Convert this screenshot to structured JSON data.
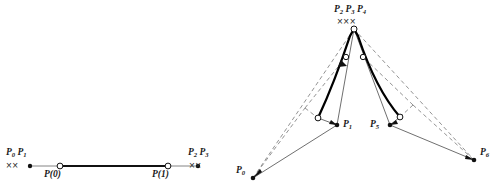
{
  "figure": {
    "caption_left": "",
    "caption_right": "",
    "background_color": "#ffffff",
    "ink_color": "#1a1a1a",
    "thick_curve_color": "#000000",
    "thin_line_color": "#555555",
    "dashed_line_color": "#777777"
  },
  "left_panel": {
    "name": "degenerate-line-segment-panel",
    "labels": {
      "start_group": "P",
      "start_group_sub_a": "0",
      "start_group_sub_b": "1",
      "start_group_text": "P0 P1",
      "end_group_text": "P2 P3",
      "end_group_sub_a": "2",
      "end_group_sub_b": "3",
      "param_start": "P",
      "param_start_arg": "(0)",
      "param_end": "P",
      "param_end_arg": "(1)"
    },
    "x_marks_left": "××",
    "x_marks_right": "××",
    "knot_multiplicity_left": 2,
    "knot_multiplicity_right": 2,
    "segment": {
      "start_x": 30,
      "start_y": 166,
      "end_x": 198,
      "end_y": 166
    },
    "open_circles": [
      {
        "label": "P(0)",
        "x": 60,
        "y": 166
      },
      {
        "label": "P(1)",
        "x": 168,
        "y": 166
      }
    ],
    "filled_dots": [
      {
        "x": 30,
        "y": 166
      },
      {
        "x": 198,
        "y": 166
      }
    ]
  },
  "right_panel": {
    "name": "cusp-curve-panel",
    "labels": {
      "apex_group_text": "P2 P3 P4",
      "apex_sub_a": "2",
      "apex_sub_b": "3",
      "apex_sub_c": "4",
      "p0": "P",
      "p0_sub": "0",
      "p1": "P",
      "p1_sub": "1",
      "p5": "P",
      "p5_sub": "5",
      "p6": "P",
      "p6_sub": "6"
    },
    "x_marks_apex": "×××",
    "knot_multiplicity_apex": 3,
    "control_points": [
      {
        "name": "P0",
        "x": 253,
        "y": 178,
        "marker": "filled"
      },
      {
        "name": "P1",
        "x": 337,
        "y": 125,
        "marker": "filled"
      },
      {
        "name": "P2P3P4",
        "x": 354,
        "y": 29,
        "marker": "open"
      },
      {
        "name": "P5",
        "x": 390,
        "y": 125,
        "marker": "filled"
      },
      {
        "name": "P6",
        "x": 474,
        "y": 160,
        "marker": "filled"
      }
    ],
    "curve_endpoints_open": [
      {
        "x": 318,
        "y": 118
      },
      {
        "x": 354,
        "y": 29
      },
      {
        "x": 400,
        "y": 117
      }
    ],
    "midpoint_open_circles": [
      {
        "x": 346,
        "y": 57
      },
      {
        "x": 363,
        "y": 57
      }
    ],
    "corner_points": [
      {
        "x": 305,
        "y": 108
      },
      {
        "x": 413,
        "y": 105
      }
    ]
  }
}
